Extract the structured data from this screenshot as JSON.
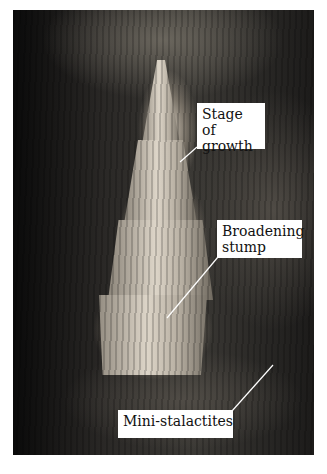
{
  "image": {
    "subject": "cave stalagmite photograph",
    "labels": [
      {
        "id": "stage-of-growth",
        "text": "Stage of growth"
      },
      {
        "id": "broadening-stump",
        "text": "Broadening stump"
      },
      {
        "id": "mini-stalactites",
        "text": "Mini-stalactites"
      }
    ]
  }
}
